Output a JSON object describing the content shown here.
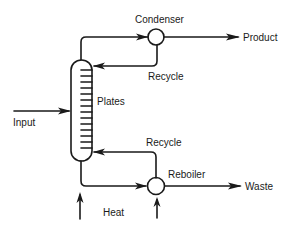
{
  "diagram": {
    "type": "process-flow",
    "nodes": [
      {
        "id": "column",
        "label": "Plates"
      },
      {
        "id": "condenser",
        "label": "Condenser"
      },
      {
        "id": "reboiler",
        "label": "Reboiler"
      }
    ],
    "labels": {
      "condenser": "Condenser",
      "product": "Product",
      "recycle_top": "Recycle",
      "plates": "Plates",
      "input": "Input",
      "recycle_bottom": "Recycle",
      "reboiler": "Reboiler",
      "waste": "Waste",
      "heat": "Heat"
    },
    "edges": [
      {
        "from": "input",
        "to": "column"
      },
      {
        "from": "column",
        "to": "condenser",
        "note": "vapor from top"
      },
      {
        "from": "condenser",
        "to": "product"
      },
      {
        "from": "condenser",
        "to": "column",
        "label": "Recycle"
      },
      {
        "from": "column",
        "to": "reboiler",
        "note": "bottoms"
      },
      {
        "from": "reboiler",
        "to": "waste"
      },
      {
        "from": "reboiler",
        "to": "column",
        "label": "Recycle"
      },
      {
        "from": "heat",
        "to": "column"
      },
      {
        "from": "heat",
        "to": "reboiler"
      }
    ],
    "plate_count": 14
  }
}
